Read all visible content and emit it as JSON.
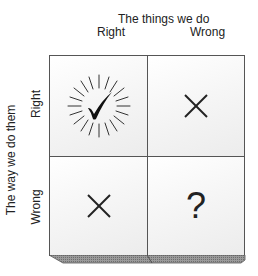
{
  "diagram": {
    "column_axis": {
      "title": "The things we do",
      "labels": [
        "Right",
        "Wrong"
      ]
    },
    "row_axis": {
      "title": "The way we do them",
      "labels": [
        "Right",
        "Wrong"
      ]
    },
    "cells": [
      {
        "row": "Right",
        "col": "Right",
        "symbol": "checkmark-burst",
        "glyph": "✓"
      },
      {
        "row": "Right",
        "col": "Wrong",
        "symbol": "cross",
        "glyph": "×"
      },
      {
        "row": "Wrong",
        "col": "Right",
        "symbol": "cross",
        "glyph": "×"
      },
      {
        "row": "Wrong",
        "col": "Wrong",
        "symbol": "question",
        "glyph": "?"
      }
    ],
    "colors": {
      "line": "#555555",
      "bevel": "#8a8a8a",
      "text": "#222222"
    }
  }
}
